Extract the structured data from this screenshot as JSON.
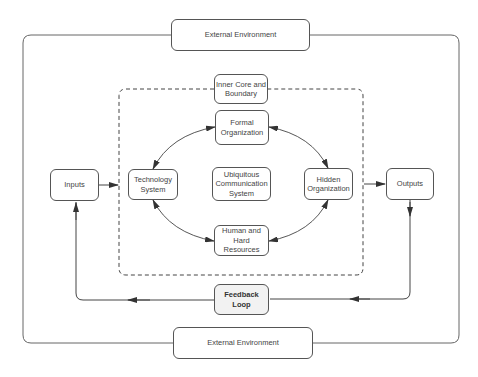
{
  "diagram": {
    "colors": {
      "stroke": "#555555",
      "text": "#444444",
      "feedback_fill": "#f2f2f2",
      "background": "#ffffff"
    },
    "nodes": {
      "external_top": "External Environment",
      "external_bottom": "External Environment",
      "inner_core": "Inner Core and Boundary",
      "formal_org": "Formal Organization",
      "technology": "Technology System",
      "ubiquitous": "Ubiquitous Communication System",
      "hidden_org": "Hidden Organization",
      "human_resources": "Human and Hard Resources",
      "inputs": "Inputs",
      "outputs": "Outputs",
      "feedback": "Feedback Loop"
    },
    "edges": [
      {
        "from": "inputs",
        "to": "inner_core_boundary",
        "type": "arrow"
      },
      {
        "from": "inner_core_boundary",
        "to": "outputs",
        "type": "arrow"
      },
      {
        "from": "outputs",
        "to": "feedback",
        "type": "arrow"
      },
      {
        "from": "feedback",
        "to": "inputs",
        "type": "arrow"
      },
      {
        "from": "technology",
        "to": "formal_org",
        "type": "bidirectional"
      },
      {
        "from": "formal_org",
        "to": "hidden_org",
        "type": "bidirectional"
      },
      {
        "from": "hidden_org",
        "to": "human_resources",
        "type": "bidirectional"
      },
      {
        "from": "human_resources",
        "to": "technology",
        "type": "bidirectional"
      }
    ]
  }
}
